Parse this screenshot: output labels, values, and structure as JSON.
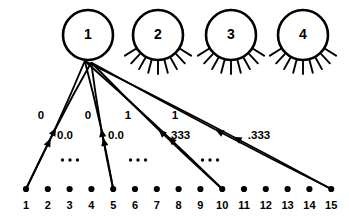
{
  "figure": {
    "title": "",
    "colors": {
      "ink": "#000000",
      "background": "#ffffff"
    }
  },
  "nodes": [
    {
      "id": "node-1",
      "label": "1",
      "cx": 88,
      "cy": 35,
      "r": 25,
      "rays": 0,
      "has_edges": true
    },
    {
      "id": "node-2",
      "label": "2",
      "cx": 158,
      "cy": 35,
      "r": 25,
      "rays": 9,
      "has_edges": false
    },
    {
      "id": "node-3",
      "label": "3",
      "cx": 231,
      "cy": 35,
      "r": 25,
      "rays": 9,
      "has_edges": false
    },
    {
      "id": "node-4",
      "label": "4",
      "cx": 303,
      "cy": 35,
      "r": 25,
      "rays": 9,
      "has_edges": false
    }
  ],
  "leaves": {
    "count": 15,
    "y": 189,
    "label_y": 206,
    "x_start": 26,
    "x_step": 21.8,
    "labels": [
      "1",
      "2",
      "3",
      "4",
      "5",
      "6",
      "7",
      "8",
      "9",
      "10",
      "11",
      "12",
      "13",
      "14",
      "15"
    ]
  },
  "edges": [
    {
      "from": "node-1",
      "to_leaf": 1,
      "weight": "0",
      "weight_x": 41,
      "weight_y": 116
    },
    {
      "from": "node-1",
      "to_leaf": 1,
      "weight": "0.0",
      "weight_x": 65,
      "weight_y": 136
    },
    {
      "from": "node-1",
      "to_leaf": 5,
      "weight": "0",
      "weight_x": 88,
      "weight_y": 116
    },
    {
      "from": "node-1",
      "to_leaf": 5,
      "weight": "0.0",
      "weight_x": 116,
      "weight_y": 136
    },
    {
      "from": "node-1",
      "to_leaf": 10,
      "weight": "1",
      "weight_x": 128,
      "weight_y": 116
    },
    {
      "from": "node-1",
      "to_leaf": 10,
      "weight": ".333",
      "weight_x": 179,
      "weight_y": 136
    },
    {
      "from": "node-1",
      "to_leaf": 15,
      "weight": "1",
      "weight_x": 175,
      "weight_y": 116
    },
    {
      "from": "node-1",
      "to_leaf": 15,
      "weight": ".333",
      "weight_x": 259,
      "weight_y": 136
    }
  ],
  "ellipses": [
    {
      "id": "ellipsis-1",
      "cx": 70,
      "cy": 160,
      "label": "..."
    },
    {
      "id": "ellipsis-2",
      "cx": 138,
      "cy": 160,
      "label": "..."
    },
    {
      "id": "ellipsis-3",
      "cx": 210,
      "cy": 160,
      "label": "..."
    }
  ]
}
